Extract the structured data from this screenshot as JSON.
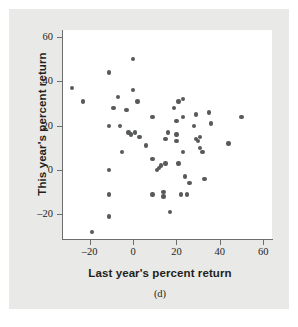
{
  "chart_data": {
    "type": "scatter",
    "title": "",
    "subtitle": "",
    "panel_label": "(d)",
    "xlabel": "Last year's percent return",
    "ylabel": "This year's percent return",
    "xlim": [
      -33,
      64
    ],
    "ylim": [
      -33,
      64
    ],
    "xticks": [
      -20,
      0,
      20,
      40,
      60
    ],
    "ytick_labels": [
      "60",
      "40",
      "20",
      "0",
      "-20"
    ],
    "xtick_labels": [
      "-20",
      "0",
      "20",
      "40",
      "60"
    ],
    "yticks": [
      60,
      40,
      20,
      0,
      -20
    ],
    "grid": false,
    "legend": null,
    "marker_color": "#58595b",
    "plot_background": "#ffffff",
    "figure_background": "#e9e9e7",
    "axis_color": "#6d6e70",
    "points": [
      {
        "x": -28,
        "y": 37
      },
      {
        "x": -23,
        "y": 31
      },
      {
        "x": -19,
        "y": -28
      },
      {
        "x": -11,
        "y": 44
      },
      {
        "x": -11,
        "y": 20
      },
      {
        "x": -11,
        "y": 0
      },
      {
        "x": -11,
        "y": -11
      },
      {
        "x": -11,
        "y": -21
      },
      {
        "x": -9,
        "y": 28
      },
      {
        "x": -7,
        "y": 33
      },
      {
        "x": -6,
        "y": 20
      },
      {
        "x": -5,
        "y": 8
      },
      {
        "x": -3,
        "y": 27
      },
      {
        "x": -2,
        "y": 17
      },
      {
        "x": -1,
        "y": 16
      },
      {
        "x": 0,
        "y": 50
      },
      {
        "x": 0,
        "y": 36
      },
      {
        "x": 1,
        "y": 17
      },
      {
        "x": 2,
        "y": 31
      },
      {
        "x": 3,
        "y": 15
      },
      {
        "x": 6,
        "y": 11
      },
      {
        "x": 9,
        "y": 24
      },
      {
        "x": 9,
        "y": 5
      },
      {
        "x": 9,
        "y": -11
      },
      {
        "x": 11,
        "y": 0
      },
      {
        "x": 12,
        "y": 1
      },
      {
        "x": 13,
        "y": 2
      },
      {
        "x": 14,
        "y": -10
      },
      {
        "x": 14,
        "y": -12
      },
      {
        "x": 15,
        "y": 14
      },
      {
        "x": 15,
        "y": 3
      },
      {
        "x": 16,
        "y": 17
      },
      {
        "x": 17,
        "y": -19
      },
      {
        "x": 19,
        "y": 28
      },
      {
        "x": 20,
        "y": 22
      },
      {
        "x": 20,
        "y": 16
      },
      {
        "x": 20,
        "y": 13
      },
      {
        "x": 21,
        "y": 3
      },
      {
        "x": 21,
        "y": 31
      },
      {
        "x": 22,
        "y": -11
      },
      {
        "x": 23,
        "y": 32
      },
      {
        "x": 23,
        "y": 24
      },
      {
        "x": 23,
        "y": 8
      },
      {
        "x": 24,
        "y": -3
      },
      {
        "x": 25,
        "y": -11
      },
      {
        "x": 26,
        "y": -6
      },
      {
        "x": 28,
        "y": 20
      },
      {
        "x": 29,
        "y": 25
      },
      {
        "x": 29,
        "y": 14
      },
      {
        "x": 30,
        "y": 13
      },
      {
        "x": 31,
        "y": 15
      },
      {
        "x": 31,
        "y": 10
      },
      {
        "x": 32,
        "y": 8
      },
      {
        "x": 33,
        "y": -4
      },
      {
        "x": 35,
        "y": 26
      },
      {
        "x": 36,
        "y": 21
      },
      {
        "x": 44,
        "y": 12
      },
      {
        "x": 50,
        "y": 24
      }
    ]
  }
}
